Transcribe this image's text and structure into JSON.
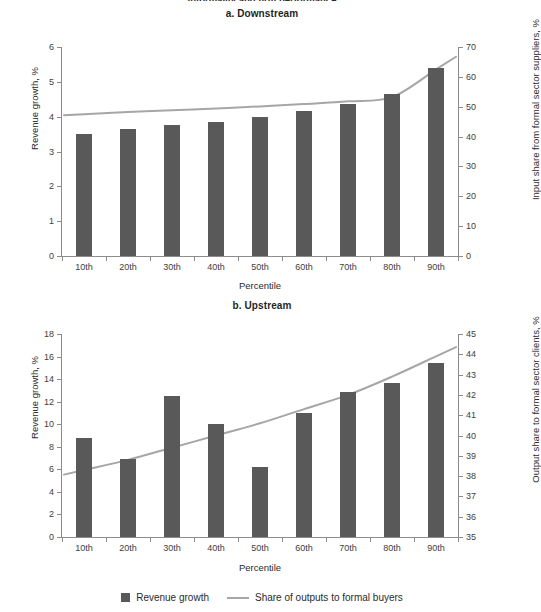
{
  "figure": {
    "clipped_top_title": "Informality and firm performance",
    "legend": [
      {
        "label": "Revenue growth",
        "marker": "bar-swatch",
        "color": "#595959"
      },
      {
        "label": "Share of outputs to formal buyers",
        "marker": "line-swatch",
        "color": "#a6a6a6"
      }
    ]
  },
  "colors": {
    "bar": "#595959",
    "line": "#a6a6a6",
    "axis": "#8c8c8c",
    "text": "#2b2b2b",
    "background": "#ffffff"
  },
  "chart_data": [
    {
      "type": "bar",
      "title": "a. Downstream",
      "xlabel": "Percentile",
      "ylabel": "Revenue growth, %",
      "y2label": "Input share from formal sector suppliers, %",
      "categories": [
        "10th",
        "20th",
        "30th",
        "40th",
        "50th",
        "60th",
        "70th",
        "80th",
        "90th"
      ],
      "ylim": [
        0,
        6
      ],
      "yticks": [
        0,
        1,
        2,
        3,
        4,
        5,
        6
      ],
      "y2lim": [
        0,
        70
      ],
      "y2ticks": [
        0,
        10,
        20,
        30,
        40,
        50,
        60,
        70
      ],
      "grid": false,
      "legend_position": "bottom-figure",
      "series": [
        {
          "name": "Revenue growth",
          "kind": "bar",
          "axis": "left",
          "values": [
            3.5,
            3.65,
            3.75,
            3.85,
            4.0,
            4.15,
            4.35,
            4.65,
            5.4
          ]
        },
        {
          "name": "Share of outputs to formal buyers",
          "kind": "line",
          "axis": "right",
          "values": [
            47.5,
            48.2,
            48.8,
            49.4,
            50.1,
            50.9,
            51.8,
            53.2,
            62.5
          ]
        }
      ]
    },
    {
      "type": "bar",
      "title": "b. Upstream",
      "xlabel": "Percentile",
      "ylabel": "Revenue growth, %",
      "y2label": "Output share to formal sector clients, %",
      "categories": [
        "10th",
        "20th",
        "30th",
        "40th",
        "50th",
        "60th",
        "70th",
        "80th",
        "90th"
      ],
      "ylim": [
        0,
        18
      ],
      "yticks": [
        0,
        2,
        4,
        6,
        8,
        10,
        12,
        14,
        16,
        18
      ],
      "y2lim": [
        35,
        45
      ],
      "y2ticks": [
        35,
        36,
        37,
        38,
        39,
        40,
        41,
        42,
        43,
        44,
        45
      ],
      "grid": false,
      "legend_position": "bottom-figure",
      "series": [
        {
          "name": "Revenue growth",
          "kind": "bar",
          "axis": "left",
          "values": [
            8.8,
            6.9,
            12.5,
            10.0,
            6.2,
            11.0,
            12.9,
            13.7,
            15.4
          ]
        },
        {
          "name": "Share of outputs to formal buyers",
          "kind": "line",
          "axis": "right",
          "values": [
            38.3,
            38.8,
            39.4,
            40.0,
            40.6,
            41.3,
            42.0,
            42.9,
            43.9
          ]
        }
      ]
    }
  ]
}
